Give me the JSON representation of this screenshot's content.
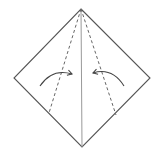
{
  "diagram": {
    "type": "origami-fold-step",
    "colors": {
      "background": "#ffffff",
      "outline": "#555555",
      "crease": "#999999",
      "dashed": "#666666",
      "arrow": "#444444"
    },
    "shape": {
      "top": [
        81,
        9
      ],
      "right": [
        150,
        78
      ],
      "bottom": [
        82,
        147
      ],
      "left": [
        14,
        78
      ]
    },
    "center_crease": {
      "from": [
        81,
        9
      ],
      "to": [
        82,
        147
      ]
    },
    "fold_lines": [
      {
        "name": "left-valley-fold",
        "from": [
          81,
          9
        ],
        "to": [
          49,
          113
        ]
      },
      {
        "name": "right-valley-fold",
        "from": [
          81,
          9
        ],
        "to": [
          116,
          115
        ]
      }
    ],
    "arrows": [
      {
        "name": "left-fold-arrow",
        "start": [
          40,
          86
        ],
        "control": [
          52,
          68
        ],
        "end": [
          72,
          74
        ]
      },
      {
        "name": "right-fold-arrow",
        "start": [
          124,
          86
        ],
        "control": [
          112,
          67
        ],
        "end": [
          93,
          73
        ]
      }
    ]
  }
}
